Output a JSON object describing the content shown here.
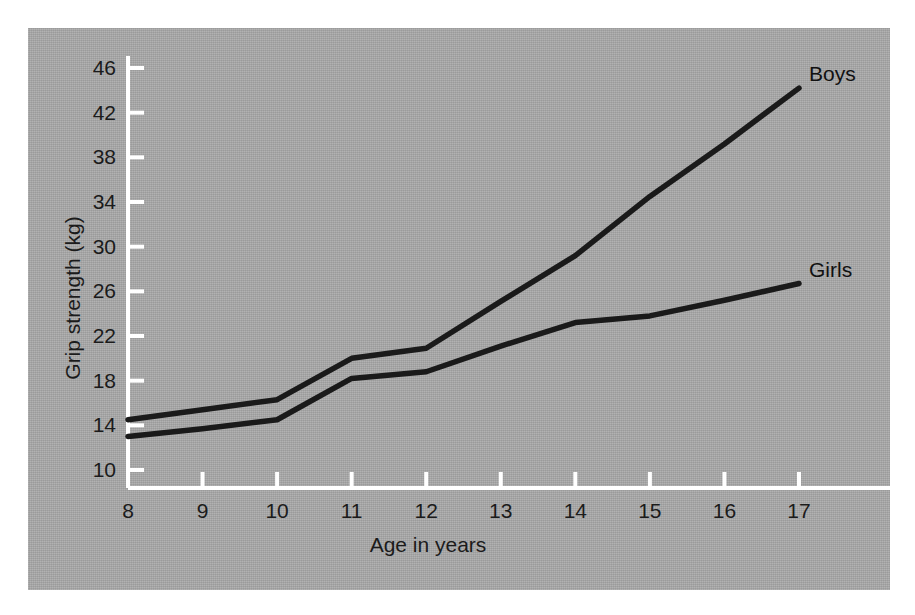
{
  "figure": {
    "background_color": "#a9a9a9",
    "page_color": "#ffffff",
    "axis_color": "#ffffff",
    "line_color": "#1a1a1a",
    "text_color": "#1b1b1b"
  },
  "chart_data": {
    "type": "line",
    "title": "",
    "xlabel": "Age in years",
    "ylabel": "Grip strength (kg)",
    "xlim": [
      8,
      17
    ],
    "ylim": [
      10,
      47
    ],
    "xticks": [
      8,
      9,
      10,
      11,
      12,
      13,
      14,
      15,
      16,
      17
    ],
    "yticks": [
      10,
      14,
      18,
      22,
      26,
      30,
      34,
      38,
      42,
      46
    ],
    "xtick_labels": [
      "8",
      "9",
      "10",
      "11",
      "12",
      "13",
      "14",
      "15",
      "16",
      "17"
    ],
    "ytick_labels": [
      "10",
      "14",
      "18",
      "22",
      "26",
      "30",
      "34",
      "38",
      "42",
      "46"
    ],
    "grid": false,
    "legend_position": "line-end-labels",
    "x": [
      8,
      9,
      10,
      11,
      12,
      13,
      14,
      15,
      16,
      17
    ],
    "series": [
      {
        "name": "Boys",
        "label": "Boys",
        "color": "#1a1a1a",
        "values": [
          14.5,
          15.4,
          16.3,
          20.0,
          20.9,
          25.1,
          29.2,
          34.5,
          39.2,
          44.2
        ]
      },
      {
        "name": "Girls",
        "label": "Girls",
        "color": "#1a1a1a",
        "values": [
          13.0,
          13.7,
          14.5,
          18.2,
          18.8,
          21.1,
          23.2,
          23.8,
          25.2,
          26.7
        ]
      }
    ]
  }
}
